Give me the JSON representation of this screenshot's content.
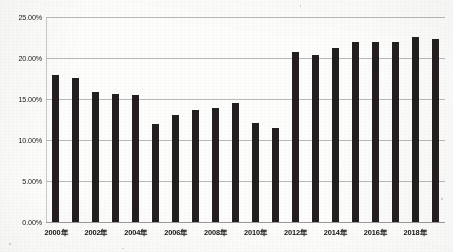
{
  "chart_data": {
    "type": "bar",
    "title": "",
    "subtitle": "",
    "xlabel": "",
    "ylabel": "",
    "grid": true,
    "legend": false,
    "legend_position": "none",
    "bar_color": "#231f20",
    "gridline_color": "#b9b9b9",
    "background_color": "#fdfdfc",
    "ylim": [
      0,
      25
    ],
    "ytick_values": [
      0,
      5,
      10,
      15,
      20,
      25
    ],
    "ytick_labels": [
      "0.00%",
      "5.00%",
      "10.00%",
      "15.00%",
      "20.00%",
      "25.00%"
    ],
    "categories": [
      "2000年",
      "2001年",
      "2002年",
      "2003年",
      "2004年",
      "2005年",
      "2006年",
      "2007年",
      "2008年",
      "2009年",
      "2010年",
      "2011年",
      "2012年",
      "2013年",
      "2014年",
      "2015年",
      "2016年",
      "2017年",
      "2018年",
      "2019年"
    ],
    "xtick_labels_shown": [
      "2000年",
      "2002年",
      "2004年",
      "2006年",
      "2008年",
      "2010年",
      "2012年",
      "2014年",
      "2016年",
      "2018年"
    ],
    "xtick_label_interval": 2,
    "values": [
      17.9,
      17.6,
      15.9,
      15.6,
      15.5,
      11.9,
      13.1,
      13.7,
      13.9,
      14.5,
      12.1,
      11.5,
      20.7,
      20.4,
      21.2,
      21.9,
      21.9,
      22.0,
      22.6,
      22.3
    ],
    "value_unit": "%"
  }
}
